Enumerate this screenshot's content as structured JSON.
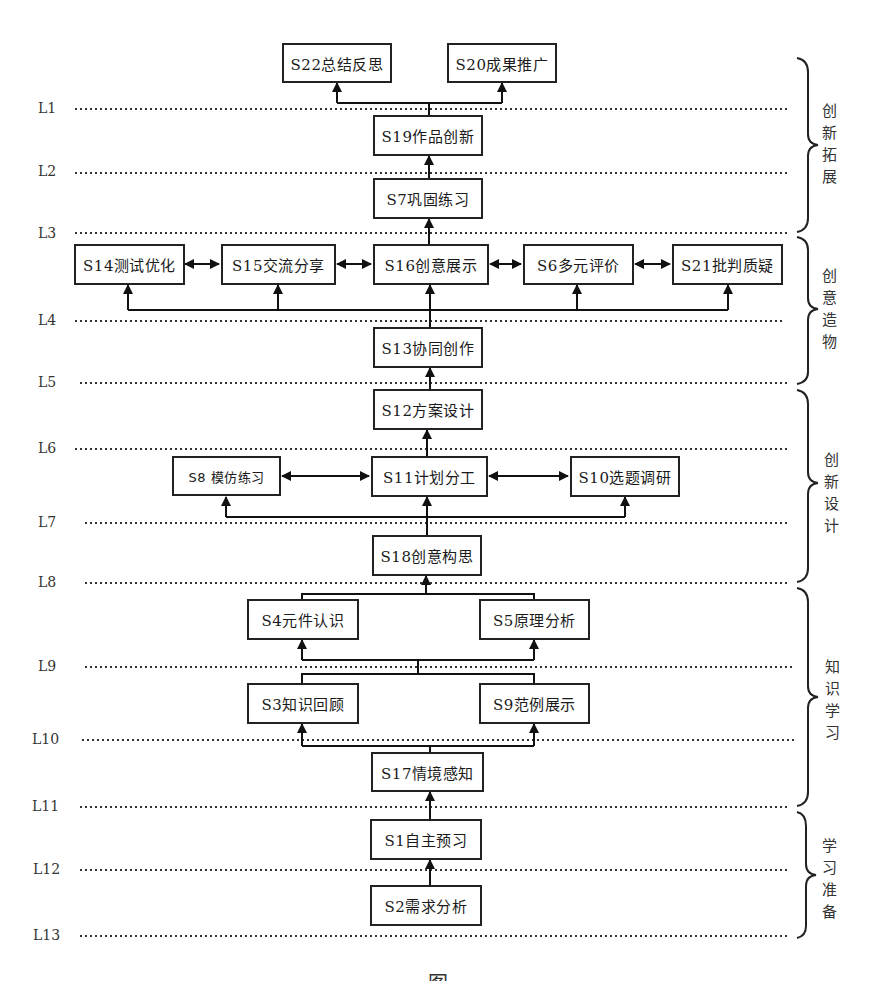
{
  "levels": [
    {
      "id": "L1",
      "label": "L1",
      "y": 109
    },
    {
      "id": "L2",
      "label": "L2",
      "y": 173
    },
    {
      "id": "L3",
      "label": "L3",
      "y": 233
    },
    {
      "id": "L4",
      "label": "L4",
      "y": 321
    },
    {
      "id": "L5",
      "label": "L5",
      "y": 383
    },
    {
      "id": "L6",
      "label": "L6",
      "y": 449
    },
    {
      "id": "L7",
      "label": "L7",
      "y": 523
    },
    {
      "id": "L8",
      "label": "L8",
      "y": 583
    },
    {
      "id": "L9",
      "label": "L9",
      "y": 667
    },
    {
      "id": "L10",
      "label": "L10",
      "y": 740
    },
    {
      "id": "L11",
      "label": "L11",
      "y": 807
    },
    {
      "id": "L12",
      "label": "L12",
      "y": 870
    },
    {
      "id": "L13",
      "label": "L13",
      "y": 936
    }
  ],
  "nodes": {
    "S22": {
      "label": "S22总结反思"
    },
    "S20": {
      "label": "S20成果推广"
    },
    "S19": {
      "label": "S19作品创新"
    },
    "S7": {
      "label": "S7巩固练习"
    },
    "S14": {
      "label": "S14测试优化"
    },
    "S15": {
      "label": "S15交流分享"
    },
    "S16": {
      "label": "S16创意展示"
    },
    "S6": {
      "label": "S6多元评价"
    },
    "S21": {
      "label": "S21批判质疑"
    },
    "S13": {
      "label": "S13协同创作"
    },
    "S12": {
      "label": "S12方案设计"
    },
    "S8": {
      "label": "S8 模仿练习"
    },
    "S11": {
      "label": "S11计划分工"
    },
    "S10": {
      "label": "S10选题调研"
    },
    "S18": {
      "label": "S18创意构思"
    },
    "S4": {
      "label": "S4元件认识"
    },
    "S5": {
      "label": "S5原理分析"
    },
    "S3": {
      "label": "S3知识回顾"
    },
    "S9": {
      "label": "S9范例展示"
    },
    "S17": {
      "label": "S17情境感知"
    },
    "S1": {
      "label": "S1自主预习"
    },
    "S2": {
      "label": "S2需求分析"
    }
  },
  "phases": [
    {
      "id": "innovation-expansion",
      "label": "创新拓展",
      "chars": [
        "创",
        "新",
        "拓",
        "展"
      ],
      "from_level": "top",
      "to_level": "L3"
    },
    {
      "id": "creative-making",
      "label": "创意造物",
      "chars": [
        "创",
        "意",
        "造",
        "物"
      ],
      "from_level": "L3",
      "to_level": "L5"
    },
    {
      "id": "innovative-design",
      "label": "创新设计",
      "chars": [
        "创",
        "新",
        "设",
        "计"
      ],
      "from_level": "L5",
      "to_level": "L8"
    },
    {
      "id": "knowledge-learning",
      "label": "知识学习",
      "chars": [
        "知",
        "识",
        "学",
        "习"
      ],
      "from_level": "L8",
      "to_level": "L11"
    },
    {
      "id": "learning-preparation",
      "label": "学习准备",
      "chars": [
        "学",
        "习",
        "准",
        "备"
      ],
      "from_level": "L11",
      "to_level": "L13"
    }
  ],
  "edges": [
    {
      "from": "S2",
      "to": "S1"
    },
    {
      "from": "S1",
      "to": "S17"
    },
    {
      "from": "S17",
      "to": "S3"
    },
    {
      "from": "S17",
      "to": "S9"
    },
    {
      "from": "S3",
      "to": "S4"
    },
    {
      "from": "S9",
      "to": "S5"
    },
    {
      "from": "S4",
      "to": "S18"
    },
    {
      "from": "S5",
      "to": "S18"
    },
    {
      "from": "S18",
      "to": "S11"
    },
    {
      "from": "S18",
      "to": "S8"
    },
    {
      "from": "S18",
      "to": "S10"
    },
    {
      "from": "S11",
      "to": "S8",
      "bidirectional": true
    },
    {
      "from": "S11",
      "to": "S10",
      "bidirectional": true
    },
    {
      "from": "S11",
      "to": "S12"
    },
    {
      "from": "S12",
      "to": "S13"
    },
    {
      "from": "S13",
      "to": "S16"
    },
    {
      "from": "S13",
      "to": "S14"
    },
    {
      "from": "S13",
      "to": "S15"
    },
    {
      "from": "S13",
      "to": "S6"
    },
    {
      "from": "S13",
      "to": "S21"
    },
    {
      "from": "S14",
      "to": "S15",
      "bidirectional": true
    },
    {
      "from": "S15",
      "to": "S16",
      "bidirectional": true
    },
    {
      "from": "S16",
      "to": "S6",
      "bidirectional": true
    },
    {
      "from": "S6",
      "to": "S21",
      "bidirectional": true
    },
    {
      "from": "S16",
      "to": "S7"
    },
    {
      "from": "S7",
      "to": "S19"
    },
    {
      "from": "S19",
      "to": "S22"
    },
    {
      "from": "S19",
      "to": "S20"
    }
  ],
  "caption": {
    "text": "图"
  }
}
